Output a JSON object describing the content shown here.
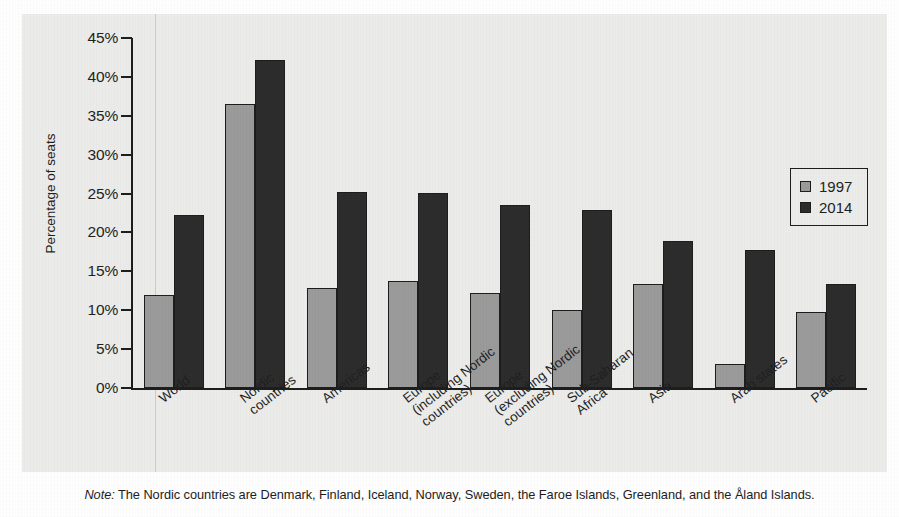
{
  "chart_data": {
    "type": "bar",
    "title": "",
    "xlabel": "",
    "ylabel": "Percentage of seats",
    "ylim": [
      0,
      45
    ],
    "ytick_labels": [
      "45%",
      "40%",
      "35%",
      "30%",
      "25%",
      "20%",
      "15%",
      "10%",
      "5%",
      "0%"
    ],
    "ytick_values": [
      45,
      40,
      35,
      30,
      25,
      20,
      15,
      10,
      5,
      0
    ],
    "grid": false,
    "legend_position": "right",
    "categories": [
      "World",
      "Nordic\ncountries",
      "Americas",
      "Europe\n(including Nordic\ncountries)",
      "Europe\n(excluding Nordic\ncountries)",
      "Sub-Saharan\nAfrica",
      "Asia",
      "Arab states",
      "Pacific"
    ],
    "series": [
      {
        "name": "1997",
        "color": "#9a9a9a",
        "values": [
          11.9,
          36.5,
          12.8,
          13.8,
          12.2,
          10.0,
          13.4,
          3.1,
          9.8
        ]
      },
      {
        "name": "2014",
        "color": "#2b2b2b",
        "values": [
          22.2,
          42.2,
          25.2,
          25.1,
          23.5,
          22.9,
          18.9,
          17.7,
          13.4
        ]
      }
    ]
  },
  "legend": {
    "entries": [
      {
        "label": "1997",
        "swatch": "gray-swatch"
      },
      {
        "label": "2014",
        "swatch": "dark-swatch"
      }
    ]
  },
  "note": {
    "prefix": "Note:",
    "text": " The Nordic countries are Denmark, Finland, Iceland, Norway, Sweden, the Faroe Islands, Greenland, and the Åland Islands."
  },
  "colors": {
    "series_1997": "#9a9a9a",
    "series_2014": "#2b2b2b",
    "axis": "#1b1b1b",
    "plot_background": "#ececea",
    "page_background": "#ffffff"
  }
}
